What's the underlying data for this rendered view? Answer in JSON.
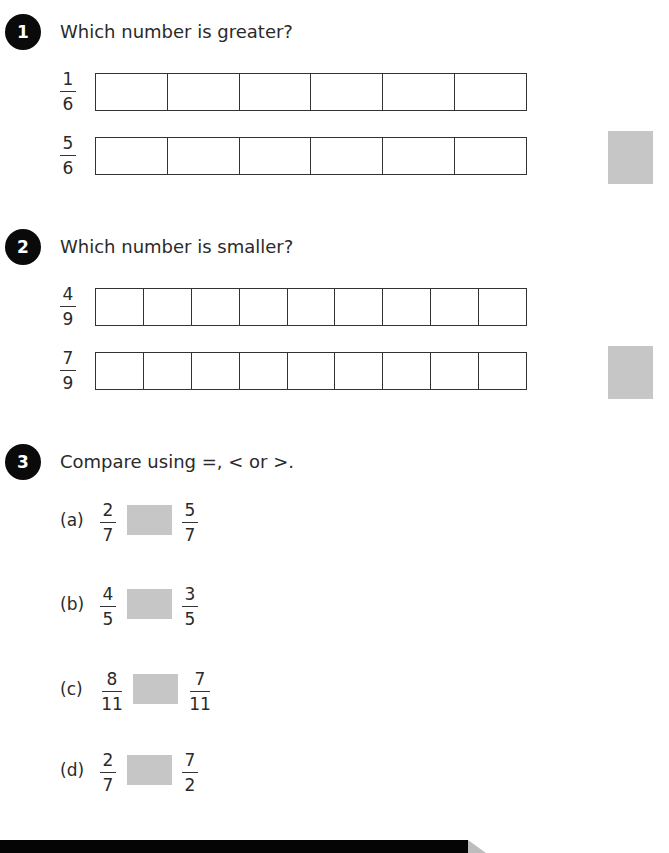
{
  "questions": [
    {
      "number": "1",
      "prompt": "Which number is greater?",
      "bars": [
        {
          "numerator": "1",
          "denominator": "6",
          "cells": 6
        },
        {
          "numerator": "5",
          "denominator": "6",
          "cells": 6
        }
      ]
    },
    {
      "number": "2",
      "prompt": "Which number is smaller?",
      "bars": [
        {
          "numerator": "4",
          "denominator": "9",
          "cells": 9
        },
        {
          "numerator": "7",
          "denominator": "9",
          "cells": 9
        }
      ]
    },
    {
      "number": "3",
      "prompt": "Compare using =, < or >.",
      "parts": [
        {
          "label": "(a)",
          "left": {
            "numerator": "2",
            "denominator": "7"
          },
          "right": {
            "numerator": "5",
            "denominator": "7"
          }
        },
        {
          "label": "(b)",
          "left": {
            "numerator": "4",
            "denominator": "5"
          },
          "right": {
            "numerator": "3",
            "denominator": "5"
          }
        },
        {
          "label": "(c)",
          "left": {
            "numerator": "8",
            "denominator": "11"
          },
          "right": {
            "numerator": "7",
            "denominator": "11"
          }
        },
        {
          "label": "(d)",
          "left": {
            "numerator": "2",
            "denominator": "7"
          },
          "right": {
            "numerator": "7",
            "denominator": "2"
          }
        }
      ]
    }
  ],
  "colors": {
    "badge": "#0a0a0a",
    "answer_box": "#c6c6c6",
    "grid_line": "#333333"
  }
}
